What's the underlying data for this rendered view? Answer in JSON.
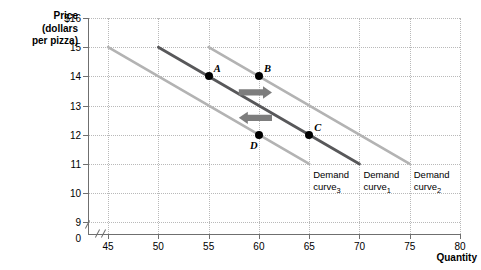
{
  "axes": {
    "y_title_lines": [
      "Price",
      "(dollars",
      "per pizza)"
    ],
    "x_title": "Quantity",
    "y_ticks": [
      "$16",
      "15",
      "14",
      "13",
      "12",
      "11",
      "10",
      "9",
      "0"
    ],
    "x_ticks": [
      "0",
      "45",
      "50",
      "55",
      "60",
      "65",
      "70",
      "75",
      "80"
    ]
  },
  "chart_data": {
    "type": "line",
    "title": "",
    "xlabel": "Quantity",
    "ylabel": "Price (dollars per pizza)",
    "xlim": [
      43,
      80
    ],
    "ylim": [
      8.6,
      16
    ],
    "xticks": [
      45,
      50,
      55,
      60,
      65,
      70,
      75,
      80
    ],
    "yticks": [
      9,
      10,
      11,
      12,
      13,
      14,
      15,
      16
    ],
    "grid": true,
    "axis_break_x": true,
    "axis_break_y": true,
    "legend": "inline-labels",
    "series": [
      {
        "name": "Demand curve3",
        "label_lines": [
          "Demand",
          "curve"
        ],
        "label_sub": "3",
        "color": "#b3b3b3",
        "width": 2.6,
        "x": [
          45,
          65
        ],
        "y": [
          15,
          11
        ],
        "label_x": 65.4,
        "label_y": 10.82
      },
      {
        "name": "Demand curve1",
        "label_lines": [
          "Demand",
          "curve"
        ],
        "label_sub": "1",
        "color": "#58585a",
        "width": 2.8,
        "x": [
          50,
          70
        ],
        "y": [
          15,
          11
        ],
        "label_x": 70.4,
        "label_y": 10.82
      },
      {
        "name": "Demand curve2",
        "label_lines": [
          "Demand",
          "curve"
        ],
        "label_sub": "2",
        "color": "#b3b3b3",
        "width": 2.6,
        "x": [
          55,
          75
        ],
        "y": [
          15,
          11
        ],
        "label_x": 75.4,
        "label_y": 10.82
      }
    ],
    "points": [
      {
        "label": "A",
        "x": 55,
        "y": 14,
        "label_dx": 5,
        "label_dy": -6
      },
      {
        "label": "B",
        "x": 60,
        "y": 14,
        "label_dx": 5,
        "label_dy": -6
      },
      {
        "label": "C",
        "x": 65,
        "y": 12,
        "label_dx": 5,
        "label_dy": -6
      },
      {
        "label": "D",
        "x": 60,
        "y": 12,
        "label_dx": -9,
        "label_dy": 12
      }
    ],
    "annotations": [
      {
        "kind": "arrow",
        "name": "shift-right-arrow",
        "direction": "right",
        "x_start": 58.0,
        "x_end": 61.3,
        "y": 13.45,
        "color": "#7d7d7d"
      },
      {
        "kind": "arrow",
        "name": "shift-left-arrow",
        "direction": "left",
        "x_start": 61.3,
        "x_end": 58.0,
        "y": 12.58,
        "color": "#7d7d7d"
      }
    ]
  }
}
